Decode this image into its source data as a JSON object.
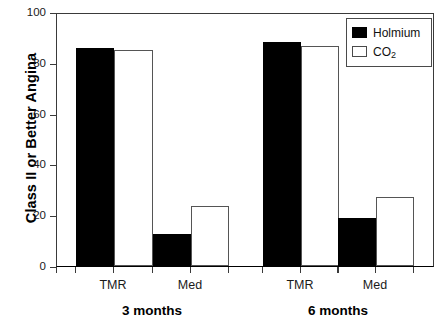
{
  "chart_data": {
    "type": "bar",
    "title": "",
    "xlabel": "",
    "ylabel": "Class II or Better Angina",
    "ylim": [
      0,
      100
    ],
    "yticks": [
      0,
      20,
      40,
      60,
      80,
      100
    ],
    "ytick_labels": [
      "0",
      "20",
      "40",
      "60",
      "80",
      "100"
    ],
    "grid": false,
    "legend_position": "top-right",
    "groups": [
      {
        "label": "3 months",
        "categories": [
          "TMR",
          "Med"
        ]
      },
      {
        "label": "6 months",
        "categories": [
          "TMR",
          "Med"
        ]
      }
    ],
    "categories": [
      "3 months / TMR",
      "3 months / Med",
      "6 months / TMR",
      "6 months / Med"
    ],
    "series": [
      {
        "name": "Holmium",
        "name_plain": "Holmium",
        "color": "#000000",
        "values": [
          86,
          12.5,
          88,
          19
        ]
      },
      {
        "name": "CO2",
        "name_plain": "CO",
        "name_sub": "2",
        "color": "#ffffff",
        "values": [
          85,
          23.5,
          86.5,
          27
        ]
      }
    ],
    "bars": [
      {
        "group": "3 months",
        "category": "TMR",
        "series": "Holmium",
        "value": 86,
        "style": "holmium",
        "x": 75,
        "w": 38
      },
      {
        "group": "3 months",
        "category": "TMR",
        "series": "CO2",
        "value": 85,
        "style": "co2",
        "x": 113,
        "w": 39
      },
      {
        "group": "3 months",
        "category": "Med",
        "series": "Holmium",
        "value": 12.5,
        "style": "holmium",
        "x": 152,
        "w": 38
      },
      {
        "group": "3 months",
        "category": "Med",
        "series": "CO2",
        "value": 23.5,
        "style": "co2",
        "x": 190,
        "w": 38
      },
      {
        "group": "6 months",
        "category": "TMR",
        "series": "Holmium",
        "value": 88,
        "style": "holmium",
        "x": 262,
        "w": 38
      },
      {
        "group": "6 months",
        "category": "TMR",
        "series": "CO2",
        "value": 86.5,
        "style": "co2",
        "x": 300,
        "w": 38
      },
      {
        "group": "6 months",
        "category": "Med",
        "series": "Holmium",
        "value": 19,
        "style": "holmium",
        "x": 337,
        "w": 38
      },
      {
        "group": "6 months",
        "category": "Med",
        "series": "CO2",
        "value": 27,
        "style": "co2",
        "x": 375,
        "w": 38
      }
    ],
    "x_category_labels": [
      {
        "text": "TMR",
        "center": 113
      },
      {
        "text": "Med",
        "center": 190
      },
      {
        "text": "TMR",
        "center": 300
      },
      {
        "text": "Med",
        "center": 375
      }
    ],
    "x_group_labels": [
      {
        "text": "3 months",
        "center": 152
      },
      {
        "text": "6 months",
        "center": 338
      }
    ]
  },
  "legend": {
    "items": [
      {
        "label": "Holmium",
        "sub": "",
        "style": "holmium"
      },
      {
        "label": "CO",
        "sub": "2",
        "style": "co2"
      }
    ]
  }
}
